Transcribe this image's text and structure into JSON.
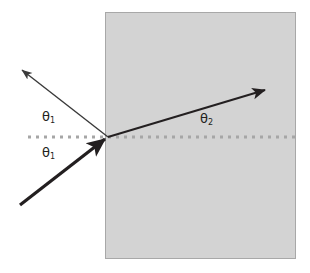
{
  "diagram": {
    "type": "optics-ray-diagram",
    "canvas": {
      "width": 310,
      "height": 273,
      "background": "#ffffff"
    },
    "colors": {
      "medium_fill": "#d3d3d3",
      "medium_border": "#a8a8a8",
      "interface_line": "#a6a6a6",
      "ray_stroke": "#231f20",
      "label_text": "#231f20"
    },
    "medium": {
      "name": "denser-medium-block",
      "x": 105,
      "y": 12,
      "width": 191,
      "height": 247,
      "fill": "#d3d3d3",
      "border_color": "#a8a8a8",
      "border_width": 1
    },
    "interface": {
      "name": "interface-dotted-line",
      "y": 137,
      "x_start": 28,
      "x_end": 296,
      "color": "#a6a6a6",
      "style": "dotted",
      "thickness": 3,
      "dot_size": 3,
      "dot_gap": 5
    },
    "incidence_point": {
      "x": 108,
      "y": 137
    },
    "rays": [
      {
        "name": "incident-ray",
        "label": "incident ray",
        "from": {
          "x": 20,
          "y": 205
        },
        "to": {
          "x": 108,
          "y": 137
        },
        "stroke_width": 3.2,
        "color": "#231f20",
        "arrowhead": "end"
      },
      {
        "name": "reflected-ray",
        "label": "reflected ray",
        "from": {
          "x": 108,
          "y": 137
        },
        "to": {
          "x": 19,
          "y": 68
        },
        "stroke_width": 1.4,
        "color": "#3a3a3a",
        "arrowhead": "end"
      },
      {
        "name": "refracted-ray",
        "label": "refracted ray",
        "from": {
          "x": 108,
          "y": 137
        },
        "to": {
          "x": 268,
          "y": 89
        },
        "stroke_width": 2.0,
        "color": "#231f20",
        "arrowhead": "end"
      }
    ],
    "labels": {
      "theta1_reflected": {
        "symbol": "θ",
        "subscript": "1",
        "x": 42,
        "y": 110
      },
      "theta1_incident": {
        "symbol": "θ",
        "subscript": "1",
        "x": 42,
        "y": 146
      },
      "theta2_refracted": {
        "symbol": "θ",
        "subscript": "2",
        "x": 200,
        "y": 112
      }
    }
  }
}
